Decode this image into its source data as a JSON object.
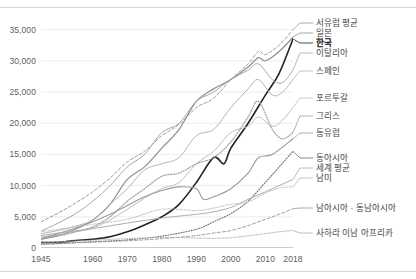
{
  "chart_data": {
    "type": "line",
    "title": "",
    "xlabel": "",
    "ylabel": "",
    "xlim": [
      1945,
      2018
    ],
    "ylim": [
      0,
      37500
    ],
    "grid": true,
    "legend_position": "right-inline",
    "x_ticks": [
      "1945",
      "1960",
      "1970",
      "1980",
      "1990",
      "2000",
      "2010",
      "2018"
    ],
    "x_tick_values": [
      1945,
      1960,
      1970,
      1980,
      1990,
      2000,
      2010,
      2018
    ],
    "y_ticks": [
      "0",
      "5,000",
      "10,000",
      "15,000",
      "20,000",
      "25,000",
      "30,000",
      "35,000"
    ],
    "y_tick_values": [
      0,
      5000,
      10000,
      15000,
      20000,
      25000,
      30000,
      35000
    ],
    "series": [
      {
        "name": "서유럽 평균",
        "style": "dashed",
        "color": "#9a9a9a",
        "width": 1.0,
        "x": [
          1945,
          1950,
          1955,
          1960,
          1965,
          1970,
          1975,
          1980,
          1985,
          1990,
          1995,
          2000,
          2005,
          2008,
          2010,
          2014,
          2018
        ],
        "values": [
          4200,
          5600,
          7200,
          9000,
          11200,
          13800,
          15500,
          18000,
          19800,
          22500,
          24000,
          27000,
          29500,
          31500,
          31000,
          32500,
          35000
        ]
      },
      {
        "name": "일본",
        "style": "solid",
        "color": "#8e8e8e",
        "width": 1.2,
        "x": [
          1945,
          1950,
          1955,
          1960,
          1965,
          1970,
          1975,
          1980,
          1985,
          1990,
          1995,
          2000,
          2005,
          2008,
          2010,
          2014,
          2018
        ],
        "values": [
          1400,
          2000,
          3000,
          4500,
          7000,
          11000,
          13000,
          16000,
          19000,
          23500,
          25500,
          27000,
          29000,
          30500,
          30000,
          31500,
          33800
        ]
      },
      {
        "name": "한국",
        "style": "solid",
        "color": "#222222",
        "width": 1.6,
        "x": [
          1945,
          1950,
          1955,
          1960,
          1965,
          1970,
          1975,
          1980,
          1985,
          1990,
          1995,
          1998,
          2000,
          2005,
          2010,
          2014,
          2018
        ],
        "values": [
          900,
          900,
          1200,
          1400,
          1800,
          2600,
          3700,
          5000,
          7000,
          10500,
          14500,
          13500,
          16000,
          20000,
          24500,
          28000,
          33500
        ]
      },
      {
        "name": "이탈리아",
        "style": "solid",
        "color": "#a8a8a8",
        "width": 1.0,
        "x": [
          1945,
          1950,
          1955,
          1960,
          1965,
          1970,
          1975,
          1980,
          1985,
          1990,
          1995,
          2000,
          2005,
          2008,
          2012,
          2015,
          2018
        ],
        "values": [
          2700,
          4000,
          5500,
          7500,
          10000,
          13000,
          15000,
          18500,
          20000,
          23500,
          25000,
          27000,
          28500,
          29500,
          27000,
          26500,
          28500
        ]
      },
      {
        "name": "스페인",
        "style": "solid",
        "color": "#b4b4b4",
        "width": 1.0,
        "x": [
          1945,
          1950,
          1955,
          1960,
          1965,
          1970,
          1975,
          1980,
          1985,
          1990,
          1995,
          2000,
          2005,
          2008,
          2012,
          2015,
          2018
        ],
        "values": [
          2300,
          2800,
          3500,
          4500,
          7000,
          9500,
          12500,
          13500,
          14500,
          18000,
          19000,
          22500,
          25500,
          27000,
          24500,
          25000,
          27000
        ]
      },
      {
        "name": "포르투갈",
        "style": "solid",
        "color": "#bdbdbd",
        "width": 1.0,
        "x": [
          1945,
          1950,
          1955,
          1960,
          1965,
          1970,
          1975,
          1980,
          1985,
          1990,
          1995,
          2000,
          2005,
          2008,
          2012,
          2015,
          2018
        ],
        "values": [
          1800,
          2100,
          2600,
          3200,
          4500,
          6200,
          8000,
          9500,
          10500,
          13500,
          15500,
          18500,
          19500,
          21000,
          19500,
          20500,
          22500
        ]
      },
      {
        "name": "그리스",
        "style": "dotted",
        "color": "#9d9d9d",
        "width": 1.2,
        "x": [
          1945,
          1950,
          1955,
          1960,
          1965,
          1970,
          1975,
          1980,
          1985,
          1990,
          1995,
          2000,
          2005,
          2008,
          2012,
          2015,
          2018
        ],
        "values": [
          1500,
          1900,
          2600,
          3400,
          5000,
          7500,
          9500,
          11500,
          12000,
          13500,
          14500,
          17000,
          21000,
          23500,
          19000,
          17500,
          18500
        ]
      },
      {
        "name": "동유럽",
        "style": "solid",
        "color": "#9a9a9a",
        "width": 1.1,
        "x": [
          1945,
          1950,
          1955,
          1960,
          1965,
          1970,
          1975,
          1980,
          1985,
          1990,
          1992,
          1995,
          2000,
          2005,
          2008,
          2012,
          2018
        ],
        "values": [
          1500,
          2300,
          3200,
          4200,
          5400,
          6800,
          8200,
          9200,
          9800,
          9500,
          7800,
          8200,
          9500,
          12000,
          14500,
          15000,
          17500
        ]
      },
      {
        "name": "동아시아",
        "style": "dotted",
        "color": "#6e6e6e",
        "width": 1.1,
        "x": [
          1945,
          1950,
          1960,
          1970,
          1980,
          1990,
          1995,
          2000,
          2005,
          2010,
          2014,
          2018
        ],
        "values": [
          600,
          700,
          1000,
          1300,
          1900,
          3000,
          4200,
          5500,
          7500,
          10500,
          13000,
          15500
        ]
      },
      {
        "name": "세계 평균",
        "style": "solid",
        "color": "#adadad",
        "width": 1.0,
        "x": [
          1945,
          1950,
          1960,
          1970,
          1980,
          1990,
          1995,
          2000,
          2005,
          2010,
          2014,
          2018
        ],
        "values": [
          2000,
          2400,
          3100,
          4000,
          4800,
          5400,
          5800,
          6500,
          7800,
          9000,
          10000,
          11000
        ]
      },
      {
        "name": "남미",
        "style": "dotted",
        "color": "#b8b8b8",
        "width": 1.0,
        "x": [
          1945,
          1950,
          1960,
          1970,
          1980,
          1990,
          1995,
          2000,
          2005,
          2010,
          2014,
          2018
        ],
        "values": [
          2600,
          3000,
          3800,
          4600,
          6200,
          6000,
          6400,
          7000,
          7400,
          8800,
          9600,
          9800
        ]
      },
      {
        "name": "남아시아 · 동남아시아",
        "style": "dashed",
        "color": "#9a9a9a",
        "width": 1.0,
        "x": [
          1945,
          1950,
          1960,
          1970,
          1980,
          1990,
          1995,
          2000,
          2005,
          2010,
          2014,
          2018
        ],
        "values": [
          700,
          800,
          950,
          1150,
          1500,
          2000,
          2400,
          2800,
          3600,
          4600,
          5400,
          6300
        ]
      },
      {
        "name": "사하라 이남 아프리카",
        "style": "dotted",
        "color": "#adadad",
        "width": 1.0,
        "x": [
          1945,
          1950,
          1960,
          1970,
          1980,
          1990,
          1995,
          2000,
          2005,
          2010,
          2014,
          2018
        ],
        "values": [
          900,
          1000,
          1250,
          1500,
          1700,
          1600,
          1550,
          1650,
          1950,
          2300,
          2600,
          2800
        ]
      }
    ]
  },
  "legend": {
    "items": [
      {
        "label": "서유럽 평균",
        "bold": false
      },
      {
        "label": "일본",
        "bold": false
      },
      {
        "label": "한국",
        "bold": true
      },
      {
        "label": "이탈리아",
        "bold": false
      },
      {
        "label": "스페인",
        "bold": false
      },
      {
        "label": "포르투갈",
        "bold": false
      },
      {
        "label": "그리스",
        "bold": false
      },
      {
        "label": "동유럽",
        "bold": false
      },
      {
        "label": "동아시아",
        "bold": false
      },
      {
        "label": "세계 평균",
        "bold": false
      },
      {
        "label": "남미",
        "bold": false
      },
      {
        "label": "남아시아 · 동남아시아",
        "bold": false
      },
      {
        "label": "사하라 이남 아프리카",
        "bold": false
      }
    ]
  }
}
